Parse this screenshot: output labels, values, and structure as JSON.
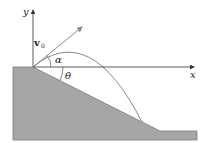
{
  "diagram": {
    "labels": {
      "y_axis": "y",
      "x_axis": "x",
      "velocity": "v",
      "velocity_subscript": "0",
      "launch_angle": "α",
      "incline_angle": "θ"
    },
    "colors": {
      "ground": "#a6a6a6",
      "ground_edge": "#7a7a7a",
      "axes": "#333333",
      "trajectory": "#8a8a8a",
      "velocity_arrow": "#8a8a8a",
      "background": "#ffffff"
    }
  }
}
